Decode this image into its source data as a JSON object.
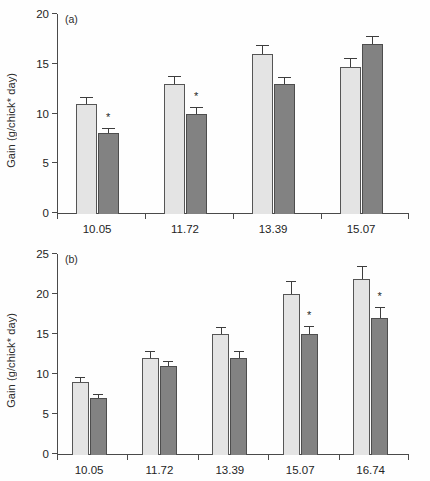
{
  "figure": {
    "ylabel": "Gain (g/chick* day)",
    "significance_marker": "*",
    "colors": {
      "light_bar": "#e4e4e4",
      "dark_bar": "#828282",
      "axis": "#4a4a4a",
      "error_bar": "#3d3d3d",
      "background": "#ffffff"
    }
  },
  "chart_data": [
    {
      "type": "bar",
      "panel": "a",
      "panel_label": "(a)",
      "title": "",
      "xlabel": "",
      "ylabel": "Gain (g/chick* day)",
      "ylim": [
        0,
        20
      ],
      "yticks": [
        0,
        5,
        10,
        15,
        20
      ],
      "ytick_labels": [
        "0",
        "5",
        "10",
        "15",
        "20"
      ],
      "grid": false,
      "legend": "none",
      "categories": [
        "10.05",
        "11.72",
        "13.39",
        "15.07"
      ],
      "series": [
        {
          "name": "light",
          "values": [
            11.0,
            13.0,
            16.0,
            14.7
          ],
          "errors": [
            0.6,
            0.7,
            0.8,
            0.8
          ],
          "significant": [
            false,
            false,
            false,
            false
          ]
        },
        {
          "name": "dark",
          "values": [
            8.0,
            10.0,
            13.0,
            17.0
          ],
          "errors": [
            0.4,
            0.6,
            0.6,
            0.7
          ],
          "significant": [
            true,
            true,
            false,
            false
          ]
        }
      ]
    },
    {
      "type": "bar",
      "panel": "b",
      "panel_label": "(b)",
      "title": "",
      "xlabel": "",
      "ylabel": "Gain (g/chick* day)",
      "ylim": [
        0,
        25
      ],
      "yticks": [
        0,
        5,
        10,
        15,
        20,
        25
      ],
      "ytick_labels": [
        "0",
        "5",
        "10",
        "15",
        "20",
        "25"
      ],
      "grid": false,
      "legend": "none",
      "categories": [
        "10.05",
        "11.72",
        "13.39",
        "15.07",
        "16.74"
      ],
      "series": [
        {
          "name": "light",
          "values": [
            9.0,
            12.0,
            15.0,
            20.0,
            21.9
          ],
          "errors": [
            0.5,
            0.8,
            0.8,
            1.5,
            1.5
          ],
          "significant": [
            false,
            false,
            false,
            false,
            false
          ]
        },
        {
          "name": "dark",
          "values": [
            7.0,
            11.0,
            12.0,
            15.0,
            17.0
          ],
          "errors": [
            0.4,
            0.5,
            0.8,
            0.9,
            1.2
          ],
          "significant": [
            false,
            false,
            false,
            true,
            true
          ]
        }
      ]
    }
  ]
}
